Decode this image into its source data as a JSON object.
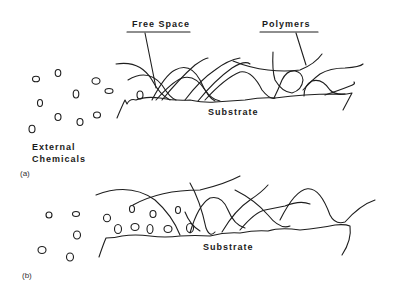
{
  "panel_a": {
    "label": "(a)",
    "free_space_label": "Free Space",
    "polymers_label": "Polymers",
    "substrate_label": "Substrate",
    "external_label_line1": "External",
    "external_label_line2": "Chemicals"
  },
  "panel_b": {
    "label": "(b)",
    "substrate_label": "Substrate"
  },
  "colors": {
    "line": "#1e1e1e",
    "background": "#ffffff"
  }
}
